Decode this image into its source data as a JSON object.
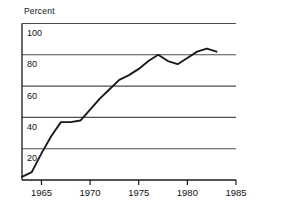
{
  "chart_data": {
    "type": "line",
    "title": "",
    "subtitle": "",
    "xlabel": "",
    "ylabel": "Percent",
    "ylabel_position": "above-axis-top-left",
    "xlim": [
      1963,
      1985
    ],
    "ylim": [
      0,
      100
    ],
    "grid": true,
    "grid_orientation": "horizontal",
    "legend": false,
    "legend_position": "none",
    "y_ticks": [
      20,
      40,
      60,
      80,
      100
    ],
    "y_tick_labels": [
      "20",
      "40",
      "60",
      "80",
      "100"
    ],
    "x_ticks": [
      1965,
      1970,
      1975,
      1980,
      1985
    ],
    "x_tick_labels": [
      "1965",
      "1970",
      "1975",
      "1980",
      "1985"
    ],
    "series": [
      {
        "name": "Percent",
        "color": "#1a1a1a",
        "x": [
          1963,
          1964,
          1965,
          1966,
          1967,
          1968,
          1969,
          1970,
          1971,
          1972,
          1973,
          1974,
          1975,
          1976,
          1977,
          1978,
          1979,
          1980,
          1981,
          1982,
          1983
        ],
        "values": [
          2,
          5,
          17,
          28,
          37,
          37,
          38,
          45,
          52,
          58,
          64,
          67,
          71,
          76,
          80,
          76,
          74,
          78,
          82,
          84,
          82
        ]
      }
    ],
    "annotations": []
  },
  "axes": {
    "y_axis_caption": "Percent"
  },
  "colors": {
    "line": "#1a1a1a",
    "grid": "#4d4d4d",
    "frame": "#1a1a1a",
    "background": "#ffffff",
    "text": "#111111"
  }
}
